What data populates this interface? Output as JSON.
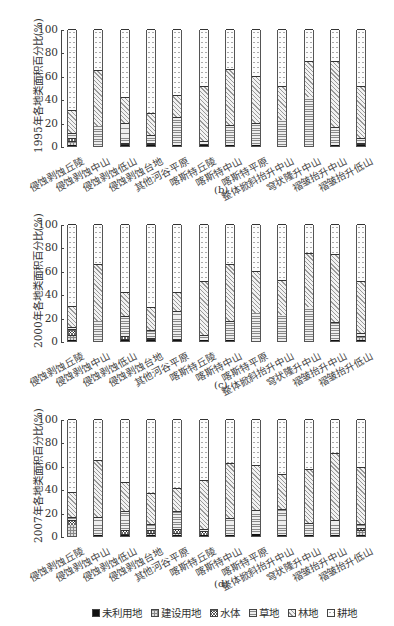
{
  "chart_data": [
    {
      "type": "bar",
      "stacked": true,
      "title": "",
      "panel_label": "(b)",
      "ylabel": "1995年各地类面积百分比(%)",
      "xlabel": "",
      "ylim": [
        0,
        100
      ],
      "yticks": [
        "0",
        "20",
        "40",
        "60",
        "80",
        "100"
      ],
      "categories": [
        "侵蚀剥蚀丘陵",
        "侵蚀剥蚀中山",
        "侵蚀剥蚀低山",
        "侵蚀剥蚀台地",
        "其他河谷平原",
        "喀斯特丘陵",
        "喀斯特中山",
        "喀斯特平原",
        "整体掀斜抬升中山",
        "穹状隆升中山",
        "褶皱抬升中山",
        "褶皱抬升低山"
      ],
      "series": [
        {
          "name": "未利用地",
          "values": [
            1,
            0,
            1,
            1,
            1,
            1,
            1,
            1,
            0,
            0,
            1,
            1
          ]
        },
        {
          "name": "建设用地",
          "values": [
            3,
            0,
            1,
            1,
            0,
            0,
            0,
            0,
            0,
            0,
            0,
            1
          ]
        },
        {
          "name": "水体",
          "values": [
            3,
            0,
            1,
            1,
            0,
            1,
            0,
            0,
            0,
            0,
            0,
            1
          ]
        },
        {
          "name": "草地",
          "values": [
            4,
            17,
            17,
            6,
            24,
            2,
            17,
            19,
            22,
            42,
            15,
            4
          ]
        },
        {
          "name": "林地",
          "values": [
            20,
            48,
            22,
            19,
            19,
            47,
            48,
            40,
            29,
            31,
            57,
            44
          ]
        },
        {
          "name": "耕地",
          "values": [
            69,
            35,
            58,
            72,
            56,
            49,
            34,
            40,
            49,
            27,
            27,
            49
          ]
        }
      ]
    },
    {
      "type": "bar",
      "stacked": true,
      "title": "",
      "panel_label": "(c)",
      "ylabel": "2000年各地类面积百分比(%)",
      "xlabel": "",
      "ylim": [
        0,
        100
      ],
      "yticks": [
        "0",
        "20",
        "40",
        "60",
        "80",
        "100"
      ],
      "categories": [
        "侵蚀剥蚀丘陵",
        "侵蚀剥蚀中山",
        "侵蚀剥蚀低山",
        "侵蚀剥蚀台地",
        "其他河谷平原",
        "喀斯特丘陵",
        "喀斯特中山",
        "喀斯特平原",
        "整体掀斜抬升中山",
        "穹状隆升中山",
        "褶皱抬升中山",
        "褶皱抬升低山"
      ],
      "series": [
        {
          "name": "未利用地",
          "values": [
            1,
            0,
            1,
            1,
            1,
            1,
            1,
            0,
            0,
            0,
            1,
            1
          ]
        },
        {
          "name": "建设用地",
          "values": [
            4,
            0,
            1,
            1,
            1,
            0,
            0,
            0,
            0,
            0,
            0,
            3
          ]
        },
        {
          "name": "水体",
          "values": [
            5,
            0,
            2,
            1,
            0,
            0,
            0,
            0,
            0,
            0,
            0,
            0
          ]
        },
        {
          "name": "草地",
          "values": [
            2,
            17,
            17,
            6,
            24,
            4,
            16,
            24,
            22,
            29,
            15,
            3
          ]
        },
        {
          "name": "林地",
          "values": [
            18,
            49,
            21,
            20,
            16,
            46,
            49,
            36,
            30,
            46,
            58,
            44
          ]
        },
        {
          "name": "耕地",
          "values": [
            70,
            34,
            58,
            71,
            58,
            49,
            34,
            40,
            48,
            25,
            26,
            49
          ]
        }
      ]
    },
    {
      "type": "bar",
      "stacked": true,
      "title": "",
      "panel_label": "(d)",
      "ylabel": "2007年各地类面积百分比(%)",
      "xlabel": "",
      "ylim": [
        0,
        100
      ],
      "yticks": [
        "0",
        "20",
        "40",
        "60",
        "80",
        "100"
      ],
      "categories": [
        "侵蚀剥蚀丘陵",
        "侵蚀剥蚀中山",
        "侵蚀剥蚀低山",
        "侵蚀剥蚀台地",
        "其他河谷平原",
        "喀斯特丘陵",
        "喀斯特中山",
        "喀斯特平原",
        "整体掀斜抬升中山",
        "穹状隆升中山",
        "褶皱抬升中山",
        "褶皱抬升低山"
      ],
      "series": [
        {
          "name": "未利用地",
          "values": [
            0,
            1,
            1,
            1,
            1,
            1,
            1,
            2,
            1,
            1,
            1,
            1
          ]
        },
        {
          "name": "建设用地",
          "values": [
            9,
            0,
            1,
            2,
            2,
            0,
            0,
            0,
            0,
            0,
            0,
            4
          ]
        },
        {
          "name": "水体",
          "values": [
            5,
            0,
            3,
            2,
            3,
            3,
            0,
            0,
            0,
            0,
            0,
            2
          ]
        },
        {
          "name": "草地",
          "values": [
            2,
            15,
            16,
            5,
            15,
            2,
            14,
            20,
            22,
            10,
            13,
            3
          ]
        },
        {
          "name": "林地",
          "values": [
            22,
            49,
            25,
            27,
            20,
            42,
            47,
            39,
            30,
            46,
            57,
            49
          ]
        },
        {
          "name": "耕地",
          "values": [
            62,
            35,
            54,
            63,
            59,
            52,
            38,
            39,
            47,
            43,
            29,
            41
          ]
        }
      ]
    }
  ],
  "legend": {
    "items": [
      {
        "label": "未利用地",
        "pattern": "unused"
      },
      {
        "label": "建设用地",
        "pattern": "built"
      },
      {
        "label": "水体",
        "pattern": "water"
      },
      {
        "label": "草地",
        "pattern": "grass"
      },
      {
        "label": "林地",
        "pattern": "forest"
      },
      {
        "label": "耕地",
        "pattern": "farm"
      }
    ]
  }
}
